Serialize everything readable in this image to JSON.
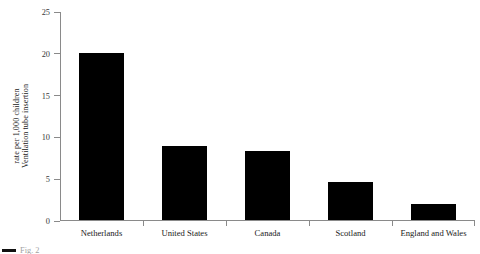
{
  "chart_data": {
    "type": "bar",
    "title": "",
    "xlabel": "",
    "ylabel_line1": "Ventilation tube insertion",
    "ylabel_line2": "rate per 1,000 children",
    "categories": [
      "Netherlands",
      "United States",
      "Canada",
      "Scotland",
      "England and Wales"
    ],
    "values": [
      20.0,
      8.8,
      8.3,
      4.6,
      1.9
    ],
    "ylim": [
      0,
      25
    ],
    "yticks": [
      0,
      5,
      10,
      15,
      20,
      25
    ],
    "ytick_labels": [
      "0",
      "5",
      "10",
      "15",
      "20",
      "25"
    ],
    "grid": false,
    "legend": false,
    "bar_color": "#000000",
    "axis_color": "#8a8a8a"
  },
  "caption": {
    "text": "Fig. 2"
  }
}
